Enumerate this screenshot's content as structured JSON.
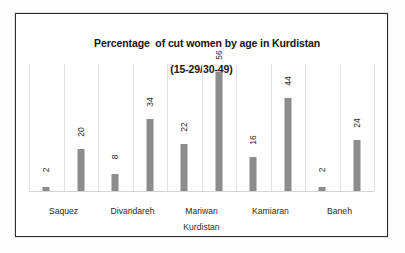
{
  "chart_data": {
    "type": "bar",
    "title_line1": "Percentage  of cut women by age in Kurdistan",
    "title_line2": "(15-29/30-49)",
    "title": "Percentage  of cut women by age in Kurdistan (15-29/30-49)",
    "xlabel": "Kurdistan",
    "ylabel": "",
    "ylim": [
      0,
      60
    ],
    "grid": "vertical-category-gridlines",
    "legend": "none",
    "categories": [
      "Saquez",
      "Divandareh",
      "Mariwan",
      "Kamiaran",
      "Baneh"
    ],
    "series": [
      {
        "name": "15-29",
        "values": [
          2,
          8,
          22,
          16,
          2
        ]
      },
      {
        "name": "30-49",
        "values": [
          20,
          34,
          56,
          44,
          24
        ]
      }
    ],
    "bars": [
      {
        "label": "2",
        "value": 2,
        "category": "Saquez"
      },
      {
        "label": "20",
        "value": 20,
        "category": "Saquez"
      },
      {
        "label": "8",
        "value": 8,
        "category": "Divandareh"
      },
      {
        "label": "34",
        "value": 34,
        "category": "Divandareh"
      },
      {
        "label": "22",
        "value": 22,
        "category": "Mariwan"
      },
      {
        "label": "56",
        "value": 56,
        "category": "Mariwan"
      },
      {
        "label": "16",
        "value": 16,
        "category": "Kamiaran"
      },
      {
        "label": "44",
        "value": 44,
        "category": "Kamiaran"
      },
      {
        "label": "2",
        "value": 2,
        "category": "Baneh"
      },
      {
        "label": "24",
        "value": 24,
        "category": "Baneh"
      }
    ],
    "colors": {
      "bar": "#8c8c8c",
      "gridline": "#e2e2e2",
      "axis": "#d4d4d4",
      "frame": "#2e2e2e",
      "plot_background": "#ffffff",
      "text": "#2b2b2b",
      "title_text": "#151515"
    }
  }
}
